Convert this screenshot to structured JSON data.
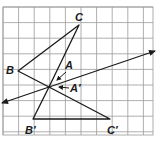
{
  "diagram": {
    "type": "geometric-reflection",
    "grid": {
      "x0": 3,
      "y0": 7,
      "x1": 153,
      "y1": 135,
      "cell": 15.6,
      "line_color": "#9a9a9a",
      "cols": 10,
      "rows": 8
    },
    "colors": {
      "ink": "#1a1a1a",
      "grid": "#9a9a9a",
      "background": "#ffffff"
    },
    "points": {
      "C": {
        "label": "C",
        "x": 79,
        "y": 25
      },
      "B": {
        "label": "B",
        "x": 18,
        "y": 71
      },
      "A": {
        "label": "A",
        "x": 49,
        "y": 87
      },
      "Bp": {
        "label": "B′",
        "x": 33,
        "y": 119
      },
      "Cp": {
        "label": "C′",
        "x": 110,
        "y": 119
      },
      "Ap": {
        "label": "A′",
        "x": 49,
        "y": 87
      }
    },
    "triangles": [
      {
        "name": "ABC",
        "vertices": [
          "A",
          "B",
          "C"
        ]
      },
      {
        "name": "A'B'C'",
        "vertices": [
          "Ap",
          "Bp",
          "Cp"
        ]
      }
    ],
    "line_of_reflection": {
      "from": {
        "x": 2,
        "y": 103
      },
      "to": {
        "x": 155,
        "y": 51
      },
      "arrows_both_ends": true
    },
    "labels": {
      "C": {
        "text": "C",
        "x": 75,
        "y": 21
      },
      "B": {
        "text": "B",
        "x": 6,
        "y": 74
      },
      "A": {
        "text": "A",
        "x": 65,
        "y": 69
      },
      "Ap": {
        "text": "A′",
        "x": 70,
        "y": 92
      },
      "Bp": {
        "text": "B′",
        "x": 25,
        "y": 134
      },
      "Cp": {
        "text": "C′",
        "x": 107,
        "y": 134
      }
    },
    "pointer_arrows": [
      {
        "for": "A",
        "from": {
          "x": 66,
          "y": 72
        },
        "to": {
          "x": 57,
          "y": 80
        }
      },
      {
        "for": "A'",
        "from": {
          "x": 69,
          "y": 88
        },
        "to": {
          "x": 59,
          "y": 87
        }
      }
    ]
  }
}
